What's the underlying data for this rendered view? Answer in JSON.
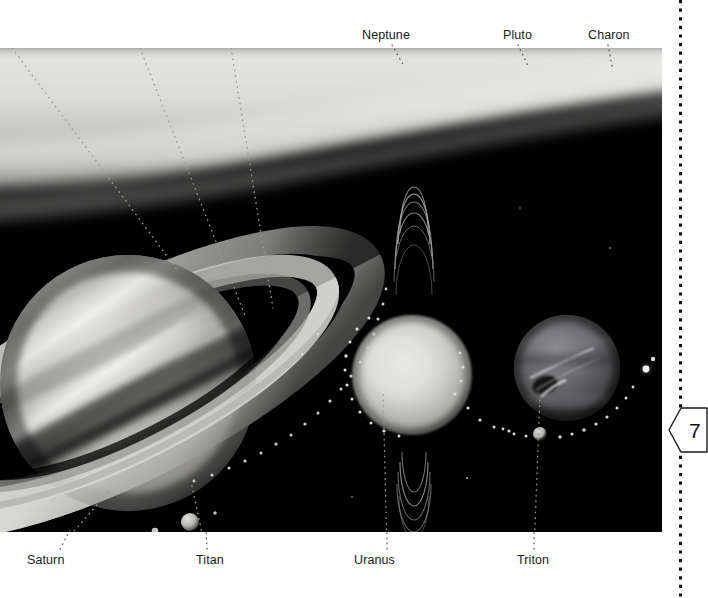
{
  "page": {
    "width": 696,
    "height": 598,
    "background_color": "#ffffff",
    "page_number": "7",
    "margin_rule_style": "vertical-dotted-line"
  },
  "figure": {
    "name": "outer-planets-plate",
    "kind": "grayscale-astronomical-illustration",
    "plate_bounds": {
      "x": 0,
      "y": 48,
      "width": 662,
      "height": 484
    },
    "background_color": "#000000",
    "bodies": [
      {
        "id": "saturn",
        "label": "Saturn",
        "type": "planet",
        "cx": 128,
        "cy": 335,
        "r": 128
      },
      {
        "id": "titan",
        "label": "Titan",
        "type": "moon",
        "cx": 190,
        "cy": 474,
        "r": 9
      },
      {
        "id": "uranus",
        "label": "Uranus",
        "type": "planet",
        "cx": 412,
        "cy": 327,
        "r": 60
      },
      {
        "id": "neptune",
        "label": "Neptune",
        "type": "planet",
        "cx": 567,
        "cy": 320,
        "r": 53
      },
      {
        "id": "triton",
        "label": "Triton",
        "type": "moon",
        "cx": 540,
        "cy": 386,
        "r": 7
      },
      {
        "id": "pluto",
        "label": "Pluto",
        "type": "dwarf-planet",
        "cx": 646,
        "cy": 321,
        "r": 3.2
      },
      {
        "id": "charon",
        "label": "Charon",
        "type": "moon",
        "cx": 653,
        "cy": 312,
        "r": 2.2
      }
    ]
  },
  "labels": {
    "top": [
      {
        "id": "neptune",
        "text": "Neptune",
        "x": 362,
        "y": 28,
        "anchor_x": 392,
        "anchor_y": 45,
        "tip_x": 546,
        "tip_y": 271
      },
      {
        "id": "pluto",
        "text": "Pluto",
        "x": 503,
        "y": 28,
        "anchor_x": 518,
        "anchor_y": 45,
        "tip_x": 644,
        "tip_y": 318
      },
      {
        "id": "charon",
        "text": "Charon",
        "x": 588,
        "y": 28,
        "anchor_x": 608,
        "anchor_y": 45,
        "tip_x": 651,
        "tip_y": 308
      }
    ],
    "bottom": [
      {
        "id": "saturn",
        "text": "Saturn",
        "x": 27,
        "y": 553,
        "anchor_x": 60,
        "anchor_y": 550,
        "tip_x": 110,
        "tip_y": 490
      },
      {
        "id": "titan",
        "text": "Titan",
        "x": 196,
        "y": 553,
        "anchor_x": 207,
        "anchor_y": 550,
        "tip_x": 192,
        "tip_y": 486
      },
      {
        "id": "uranus",
        "text": "Uranus",
        "x": 354,
        "y": 553,
        "anchor_x": 386,
        "anchor_y": 550,
        "tip_x": 382,
        "tip_y": 390
      },
      {
        "id": "triton",
        "text": "Triton",
        "x": 517,
        "y": 553,
        "anchor_x": 534,
        "anchor_y": 550,
        "tip_x": 540,
        "tip_y": 396
      }
    ]
  },
  "colors": {
    "plate_background": "#000000",
    "page_background": "#ffffff",
    "label_text": "#1a1a1a",
    "leader_line": "#3a3a3a",
    "margin_dots": "#111111",
    "saturn_highlight": "#e8e8e6",
    "saturn_shadow": "#4a4a48",
    "uranus_body": "#cfcfcb",
    "neptune_body": "#5a5a5c"
  }
}
